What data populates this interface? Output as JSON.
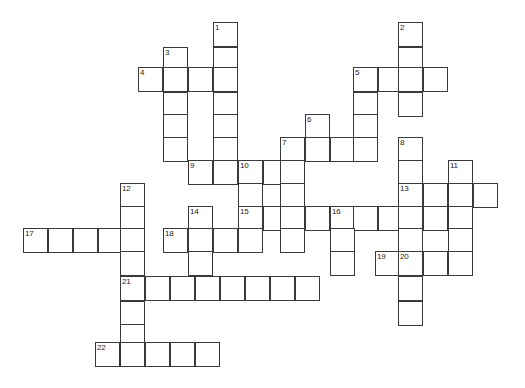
{
  "puzzle": {
    "type": "crossword-grid",
    "title": "",
    "cell_size_px": 25,
    "grid_origin": {
      "x": 23,
      "y": 22
    },
    "colors": {
      "cell_border": "#3a3a3a",
      "cell_fill": "#ffffff",
      "page_background": "#ffffff",
      "number_text": "#222222"
    },
    "clue_count": 22,
    "clue_numbers": [
      1,
      2,
      3,
      4,
      5,
      6,
      7,
      8,
      9,
      10,
      11,
      12,
      13,
      14,
      15,
      16,
      17,
      18,
      19,
      20,
      21,
      22
    ],
    "entries": [
      {
        "number": 1,
        "direction": "down",
        "col": 8,
        "row": 0,
        "length": 6
      },
      {
        "number": 2,
        "direction": "down",
        "col": 15,
        "row": 0,
        "length": 6
      },
      {
        "number": 3,
        "direction": "down",
        "col": 6,
        "row": 1,
        "length": 5
      },
      {
        "number": 4,
        "direction": "across",
        "col": 5,
        "row": 2,
        "length": 4
      },
      {
        "number": 5,
        "direction": "down",
        "col": 13,
        "row": 2,
        "length": 3
      },
      {
        "number": 5,
        "direction": "across",
        "col": 13,
        "row": 2,
        "length": 4
      },
      {
        "number": 6,
        "direction": "down",
        "col": 11,
        "row": 4,
        "length": 3
      },
      {
        "number": 7,
        "direction": "across",
        "col": 10,
        "row": 5,
        "length": 4
      },
      {
        "number": 7,
        "direction": "down",
        "col": 10,
        "row": 5,
        "length": 3
      },
      {
        "number": 8,
        "direction": "down",
        "col": 15,
        "row": 5,
        "length": 5
      },
      {
        "number": 9,
        "direction": "across",
        "col": 6,
        "row": 6,
        "length": 4
      },
      {
        "number": 10,
        "direction": "down",
        "col": 9,
        "row": 6,
        "length": 5
      },
      {
        "number": 11,
        "direction": "down",
        "col": 17,
        "row": 6,
        "length": 5
      },
      {
        "number": 12,
        "direction": "down",
        "col": 4,
        "row": 7,
        "length": 7
      },
      {
        "number": 13,
        "direction": "across",
        "col": 15,
        "row": 7,
        "length": 4
      },
      {
        "number": 14,
        "direction": "down",
        "col": 7,
        "row": 8,
        "length": 3
      },
      {
        "number": 15,
        "direction": "across",
        "col": 9,
        "row": 8,
        "length": 9
      },
      {
        "number": 16,
        "direction": "down",
        "col": 12,
        "row": 8,
        "length": 3
      },
      {
        "number": 17,
        "direction": "across",
        "col": 0,
        "row": 9,
        "length": 5
      },
      {
        "number": 18,
        "direction": "across",
        "col": 6,
        "row": 9,
        "length": 4
      },
      {
        "number": 19,
        "direction": "across",
        "col": 14,
        "row": 10,
        "length": 4
      },
      {
        "number": 20,
        "direction": "down",
        "col": 15,
        "row": 10,
        "length": 3
      },
      {
        "number": 21,
        "direction": "across",
        "col": 4,
        "row": 11,
        "length": 8
      },
      {
        "number": 22,
        "direction": "across",
        "col": 3,
        "row": 14,
        "length": 5
      }
    ],
    "cells": [
      {
        "x": 213,
        "y": 22,
        "num": "1"
      },
      {
        "x": 398,
        "y": 22,
        "num": "2"
      },
      {
        "x": 213,
        "y": 47
      },
      {
        "x": 163,
        "y": 47,
        "num": "3"
      },
      {
        "x": 398,
        "y": 47
      },
      {
        "x": 138,
        "y": 67,
        "num": "4"
      },
      {
        "x": 163,
        "y": 67
      },
      {
        "x": 188,
        "y": 67
      },
      {
        "x": 213,
        "y": 67
      },
      {
        "x": 353,
        "y": 67,
        "num": "5"
      },
      {
        "x": 378,
        "y": 67
      },
      {
        "x": 398,
        "y": 67
      },
      {
        "x": 423,
        "y": 67
      },
      {
        "x": 163,
        "y": 92
      },
      {
        "x": 213,
        "y": 92
      },
      {
        "x": 353,
        "y": 92
      },
      {
        "x": 398,
        "y": 92
      },
      {
        "x": 163,
        "y": 114
      },
      {
        "x": 213,
        "y": 114
      },
      {
        "x": 305,
        "y": 114,
        "num": "6"
      },
      {
        "x": 353,
        "y": 114
      },
      {
        "x": 163,
        "y": 137
      },
      {
        "x": 213,
        "y": 137
      },
      {
        "x": 280,
        "y": 137,
        "num": "7"
      },
      {
        "x": 305,
        "y": 137
      },
      {
        "x": 330,
        "y": 137
      },
      {
        "x": 353,
        "y": 137
      },
      {
        "x": 398,
        "y": 137,
        "num": "8"
      },
      {
        "x": 188,
        "y": 160,
        "num": "9"
      },
      {
        "x": 213,
        "y": 160
      },
      {
        "x": 238,
        "y": 160,
        "num": "10"
      },
      {
        "x": 263,
        "y": 160
      },
      {
        "x": 280,
        "y": 160
      },
      {
        "x": 398,
        "y": 160
      },
      {
        "x": 448,
        "y": 160,
        "num": "11"
      },
      {
        "x": 120,
        "y": 183,
        "num": "12"
      },
      {
        "x": 238,
        "y": 183
      },
      {
        "x": 280,
        "y": 183
      },
      {
        "x": 398,
        "y": 183,
        "num": "13"
      },
      {
        "x": 423,
        "y": 183
      },
      {
        "x": 448,
        "y": 183
      },
      {
        "x": 473,
        "y": 183
      },
      {
        "x": 120,
        "y": 206
      },
      {
        "x": 188,
        "y": 206,
        "num": "14"
      },
      {
        "x": 238,
        "y": 206,
        "num": "15"
      },
      {
        "x": 263,
        "y": 206
      },
      {
        "x": 280,
        "y": 206
      },
      {
        "x": 305,
        "y": 206
      },
      {
        "x": 330,
        "y": 206,
        "num": "16"
      },
      {
        "x": 353,
        "y": 206
      },
      {
        "x": 378,
        "y": 206
      },
      {
        "x": 398,
        "y": 206
      },
      {
        "x": 423,
        "y": 206
      },
      {
        "x": 448,
        "y": 206
      },
      {
        "x": 23,
        "y": 228,
        "num": "17"
      },
      {
        "x": 48,
        "y": 228
      },
      {
        "x": 73,
        "y": 228
      },
      {
        "x": 98,
        "y": 228
      },
      {
        "x": 120,
        "y": 228
      },
      {
        "x": 163,
        "y": 228,
        "num": "18"
      },
      {
        "x": 188,
        "y": 228
      },
      {
        "x": 213,
        "y": 228
      },
      {
        "x": 238,
        "y": 228
      },
      {
        "x": 280,
        "y": 228
      },
      {
        "x": 330,
        "y": 228
      },
      {
        "x": 398,
        "y": 228
      },
      {
        "x": 448,
        "y": 228
      },
      {
        "x": 120,
        "y": 251
      },
      {
        "x": 188,
        "y": 251
      },
      {
        "x": 330,
        "y": 251
      },
      {
        "x": 375,
        "y": 251,
        "num": "19"
      },
      {
        "x": 398,
        "y": 251,
        "num": "20"
      },
      {
        "x": 423,
        "y": 251
      },
      {
        "x": 448,
        "y": 251
      },
      {
        "x": 120,
        "y": 276,
        "num": "21"
      },
      {
        "x": 145,
        "y": 276
      },
      {
        "x": 170,
        "y": 276
      },
      {
        "x": 195,
        "y": 276
      },
      {
        "x": 220,
        "y": 276
      },
      {
        "x": 245,
        "y": 276
      },
      {
        "x": 270,
        "y": 276
      },
      {
        "x": 295,
        "y": 276
      },
      {
        "x": 398,
        "y": 276
      },
      {
        "x": 120,
        "y": 301
      },
      {
        "x": 398,
        "y": 301
      },
      {
        "x": 120,
        "y": 324
      },
      {
        "x": 95,
        "y": 342,
        "num": "22"
      },
      {
        "x": 120,
        "y": 342
      },
      {
        "x": 145,
        "y": 342
      },
      {
        "x": 170,
        "y": 342
      },
      {
        "x": 195,
        "y": 342
      }
    ]
  }
}
